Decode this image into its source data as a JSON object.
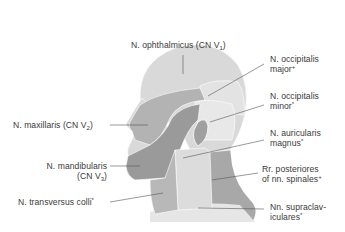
{
  "diagram": {
    "colors": {
      "background": "#ffffff",
      "v1_region": "#d9d9d9",
      "v2_region": "#b3b3b3",
      "v3_region": "#9a9a9a",
      "occipital_major_region": "#e3e3e3",
      "occipital_minor_region": "#e8e8e8",
      "auricularis_region": "#dcdcdc",
      "posterior_rami_region": "#a8a8a8",
      "transversus_colli_region": "#b8b8b8",
      "supraclavicular_region": "#e6e6e6",
      "outline": "#ffffff",
      "leader_line": "#555555",
      "label_text": "#3a3a3a"
    },
    "labels": {
      "ophthalmicus": {
        "text": "N. ophthalmicus (CN V",
        "sub": "1",
        "tail": ")"
      },
      "occipitalis_major": {
        "line1": "N. occipitalis",
        "line2": "major",
        "sup": "+"
      },
      "occipitalis_minor": {
        "line1": "N. occipitalis",
        "line2": "minor",
        "sup": "*"
      },
      "maxillaris": {
        "text": "N. maxillaris (CN V",
        "sub": "2",
        "tail": ")"
      },
      "auricularis_magnus": {
        "line1": "N. auricularis",
        "line2": "magnus",
        "sup": "*"
      },
      "mandibularis": {
        "line1": "N. mandibularis",
        "line2": "(CN V",
        "sub": "3",
        "tail": ")"
      },
      "rr_posteriores": {
        "line1": "Rr. posteriores",
        "line2": "of nn. spinales",
        "sup": "+"
      },
      "transversus_colli": {
        "text": "N. transversus colli",
        "sup": "*"
      },
      "supraclaviculares": {
        "line1": "Nn. supraclav-",
        "line2": "iculares",
        "sup": "*"
      }
    }
  }
}
